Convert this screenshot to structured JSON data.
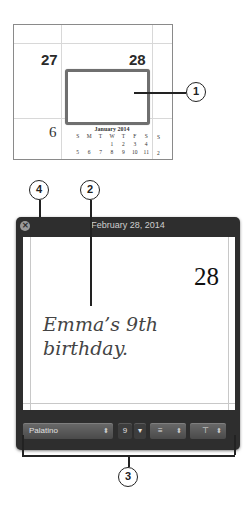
{
  "calendar_preview": {
    "day_left": "27",
    "day_right": "28",
    "day_bottom_left": "6",
    "mini_month": {
      "title": "January 2014",
      "weekday_headers": [
        "S",
        "M",
        "T",
        "W",
        "T",
        "F",
        "S"
      ],
      "rows": [
        [
          "",
          "",
          "",
          "1",
          "2",
          "3",
          "4"
        ],
        [
          "5",
          "6",
          "7",
          "8",
          "9",
          "10",
          "11"
        ]
      ],
      "right_column": [
        "S",
        "",
        "2"
      ]
    }
  },
  "callouts": {
    "c1": "1",
    "c2": "2",
    "c3": "3",
    "c4": "4"
  },
  "window": {
    "title": "February 28, 2014",
    "close_glyph": "✕",
    "day_number": "28",
    "event_text": "Emma’s 9th birthday.",
    "toolbar": {
      "font": "Palatino",
      "font_arrows": "⬍",
      "size": "9",
      "size_stepper": "▾",
      "align_icon": "≡",
      "align_arrows": "⬍",
      "valign_icon": "⊤",
      "valign_arrows": "⬍"
    }
  }
}
